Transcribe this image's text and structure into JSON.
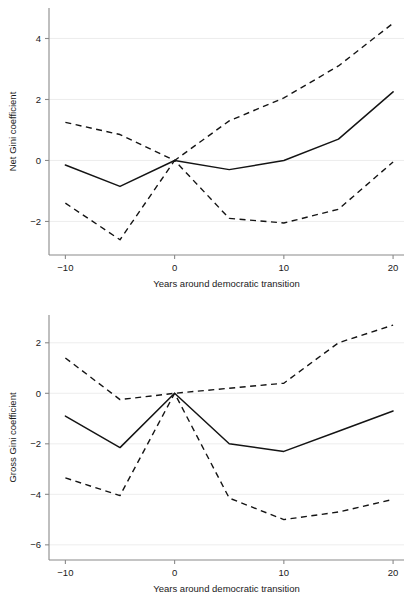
{
  "figure": {
    "background": "#ffffff",
    "line_color": "#141414",
    "grid_color": "#e8e8e8",
    "axis_color": "#8a8a8a"
  },
  "chart_data": [
    {
      "type": "line",
      "panel": "top",
      "title": "",
      "xlabel": "Years around democratic transition",
      "ylabel": "Net Gini coefficient",
      "x": [
        -10,
        -5,
        0,
        5,
        10,
        15,
        20
      ],
      "xlim": [
        -11.5,
        21
      ],
      "ylim": [
        -3.1,
        5.0
      ],
      "xticks": [
        -10,
        0,
        10,
        20
      ],
      "xticklabels": [
        "-10",
        "0",
        "10",
        "20"
      ],
      "yticks": [
        -2,
        0,
        2,
        4
      ],
      "yticklabels": [
        "-2",
        "0",
        "2",
        "4"
      ],
      "grid": "horizontal",
      "legend": "none",
      "series": [
        {
          "name": "Point estimate",
          "style": "solid",
          "values": [
            -0.15,
            -0.85,
            0,
            -0.3,
            0.0,
            0.7,
            2.25
          ]
        },
        {
          "name": "Upper confidence bound",
          "style": "dashed",
          "values": [
            1.25,
            0.85,
            0,
            1.3,
            2.05,
            3.1,
            4.5
          ]
        },
        {
          "name": "Lower confidence bound",
          "style": "dashed",
          "values": [
            -1.4,
            -2.6,
            0,
            -1.9,
            -2.05,
            -1.6,
            -0.05
          ]
        }
      ]
    },
    {
      "type": "line",
      "panel": "bottom",
      "title": "",
      "xlabel": "Years around democratic transition",
      "ylabel": "Gross Gini coefficient",
      "x": [
        -10,
        -5,
        0,
        5,
        10,
        15,
        20
      ],
      "xlim": [
        -11.5,
        21
      ],
      "ylim": [
        -6.6,
        3.1
      ],
      "xticks": [
        -10,
        0,
        10,
        20
      ],
      "xticklabels": [
        "-10",
        "0",
        "10",
        "20"
      ],
      "yticks": [
        -6,
        -4,
        -2,
        0,
        2
      ],
      "yticklabels": [
        "-6",
        "-4",
        "-2",
        "0",
        "2"
      ],
      "grid": "horizontal",
      "legend": "none",
      "series": [
        {
          "name": "Point estimate",
          "style": "solid",
          "values": [
            -0.9,
            -2.15,
            0,
            -2.0,
            -2.3,
            -1.5,
            -0.7
          ]
        },
        {
          "name": "Upper confidence bound",
          "style": "dashed",
          "values": [
            1.4,
            -0.25,
            0,
            0.2,
            0.4,
            2.0,
            2.7
          ]
        },
        {
          "name": "Lower confidence bound",
          "style": "dashed",
          "values": [
            -3.35,
            -4.05,
            0,
            -4.15,
            -5.0,
            -4.7,
            -4.2
          ]
        }
      ]
    }
  ]
}
